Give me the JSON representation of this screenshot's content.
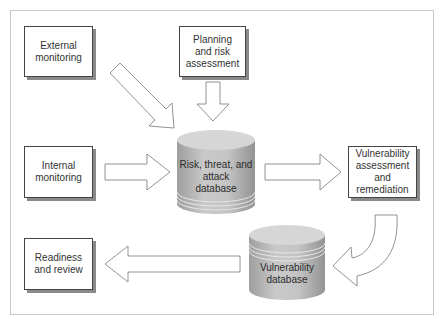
{
  "diagram": {
    "nodes": {
      "external_monitoring": {
        "label": "External monitoring",
        "line1": "External",
        "line2": "monitoring"
      },
      "planning": {
        "label": "Planning and risk assessment",
        "line1": "Planning",
        "line2": "and risk",
        "line3": "assessment"
      },
      "internal_monitoring": {
        "label": "Internal monitoring",
        "line1": "Internal",
        "line2": "monitoring"
      },
      "risk_db": {
        "label": "Risk, threat, and attack database",
        "line1": "Risk, threat, and",
        "line2": "attack",
        "line3": "database"
      },
      "vuln_assessment": {
        "label": "Vulnerability assessment and remediation",
        "line1": "Vulnerability",
        "line2": "assessment",
        "line3": "and remediation"
      },
      "vuln_db": {
        "label": "Vulnerability database",
        "line1": "Vulnerability",
        "line2": "database"
      },
      "readiness": {
        "label": "Readiness and review",
        "line1": "Readiness",
        "line2": "and review"
      }
    },
    "edges": [
      {
        "from": "External monitoring",
        "to": "Risk, threat, and attack database"
      },
      {
        "from": "Planning and risk assessment",
        "to": "Risk, threat, and attack database"
      },
      {
        "from": "Internal monitoring",
        "to": "Risk, threat, and attack database"
      },
      {
        "from": "Risk, threat, and attack database",
        "to": "Vulnerability assessment and remediation"
      },
      {
        "from": "Vulnerability assessment and remediation",
        "to": "Vulnerability database"
      },
      {
        "from": "Vulnerability database",
        "to": "Readiness and review"
      }
    ],
    "colors": {
      "border": "#444444",
      "shadow": "#8a8a8a",
      "cylinder": "#b5b5b5",
      "cylinder_top": "#d4d4d4",
      "frame": "#c8c8c8"
    }
  }
}
